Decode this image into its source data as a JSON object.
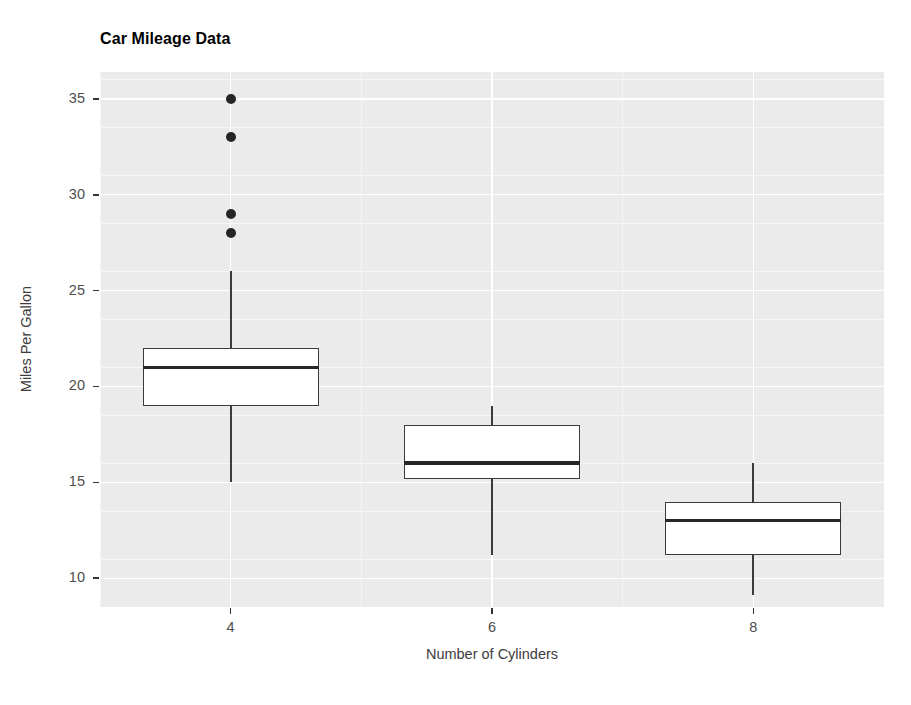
{
  "chart_data": {
    "type": "box",
    "title": "Car Mileage Data",
    "xlabel": "Number of Cylinders",
    "ylabel": "Miles Per Gallon",
    "x_categories": [
      "4",
      "6",
      "8"
    ],
    "x_tick_labels": [
      "4",
      "6",
      "8"
    ],
    "y_tick_labels": [
      "10",
      "15",
      "20",
      "25",
      "30",
      "35"
    ],
    "y_ticks": [
      10,
      15,
      20,
      25,
      30,
      35
    ],
    "ylim": [
      8.5,
      36.4
    ],
    "grid": "white gridlines on gray panel, major and minor, horizontal and vertical",
    "legend": "none",
    "panel_background": "#ebebeb",
    "gridline_color": "#ffffff",
    "box_fill": "#ffffff",
    "box_stroke": "#3b3b3b",
    "median_color": "#262626",
    "outlier_color": "#262626",
    "boxes": [
      {
        "category": "4",
        "lower_whisker": 15.0,
        "q1": 19.0,
        "median": 21.0,
        "q3": 22.0,
        "upper_whisker": 26.0,
        "outliers": [
          35.0,
          33.0,
          29.0,
          28.0
        ]
      },
      {
        "category": "6",
        "lower_whisker": 11.2,
        "q1": 15.2,
        "median": 16.0,
        "q3": 18.0,
        "upper_whisker": 19.0,
        "outliers": []
      },
      {
        "category": "8",
        "lower_whisker": 9.1,
        "q1": 11.2,
        "median": 13.0,
        "q3": 14.0,
        "upper_whisker": 16.0,
        "outliers": []
      }
    ]
  }
}
